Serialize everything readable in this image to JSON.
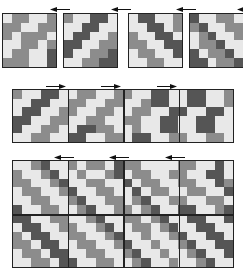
{
  "colors": {
    "light": "#e8e8e8",
    "mid": "#8c8c8c",
    "dark": "#555555",
    "border": "#222222"
  },
  "top_row": {
    "arrow_direction": "left",
    "panels": [
      {
        "rows": [
          "LMMLLM",
          "MMLLMM",
          "MLMMML",
          "LLMMLM",
          "LMMLLD",
          "MMMLLD"
        ]
      },
      {
        "rows": [
          "MLLDDL",
          "LLDDLL",
          "LDDLLM",
          "DDLLMM",
          "DLLMMD",
          "LLMMDD"
        ]
      },
      {
        "rows": [
          "LDDLLM",
          "LLDDLM",
          "MLLDDL",
          "MMLLDD",
          "LMMLLD",
          "LLMMLL"
        ]
      },
      {
        "rows": [
          "DLLMML",
          "MDLLMM",
          "LMDLLM",
          "LMMDLL",
          "DLMMDL",
          "DDLMMD"
        ]
      }
    ]
  },
  "middle_strip": {
    "arrow_direction": "right",
    "sections": 4,
    "rows": [
      "MLLDDLLMMLLMMLLDDLLDDLLM",
      "LLDDLLMMLLMMLLMDDLLDDLLM",
      "LDDLLMMLLMMLLMMLLDDLLDDL",
      "DDLLMMLLMMLLMMLLDDLLDDLL",
      "DLLMMLLDDMMLLMLLDDLLDDLL",
      "LLMMLLDDLLMMLDDLLMMLLMML"
    ]
  },
  "bottom_grid": {
    "arrow_direction": "left",
    "sections": 4,
    "rows": [
      "LLMDLLMLMMLDMMLLLLMMLLDL",
      "MLLMDLLMLLMDLMMLLMMLLDDL",
      "MMLLMDLLMMLLDLMMLLMMLLDM",
      "LMMLLMDLLMMLLDLMMLLMMLLD",
      "LLMMLLMDLLMMLMDLLMMLLMML",
      "DLLMMLLMDLLMMLMDLLDDLLMD",
      "DDLLMMLLMDLLMMLMDLLDDLLD",
      "LDDLLMMLLMDLLMMLMDLLDDLL",
      "MLDDLLMMLLMDLLMLLMDLLDDL",
      "MMLDDLLMMLLMDLLMLLMDLLDD",
      "LMMLDDLLMMLLMDLLMLLMDLLD",
      "LLMMLDDLLMMLLMDLLMLLMDLL"
    ]
  }
}
